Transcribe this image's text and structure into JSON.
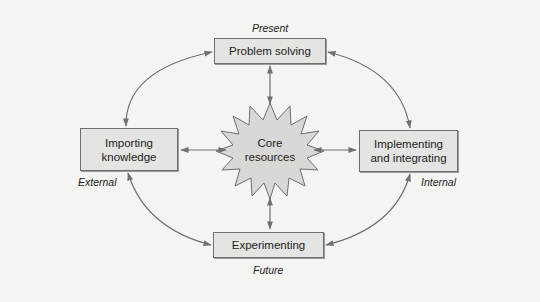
{
  "diagram": {
    "center": {
      "label_line1": "Core",
      "label_line2": "resources",
      "shape": "starburst"
    },
    "nodes": {
      "top": {
        "label": "Problem solving",
        "tag": "Present"
      },
      "left": {
        "label_line1": "Importing",
        "label_line2": "knowledge",
        "tag": "External"
      },
      "right": {
        "label_line1": "Implementing",
        "label_line2": "and integrating",
        "tag": "Internal"
      },
      "bottom": {
        "label": "Experimenting",
        "tag": "Future"
      }
    },
    "connections": [
      {
        "from": "Problem solving",
        "to": "Core resources",
        "type": "bidirectional"
      },
      {
        "from": "Importing knowledge",
        "to": "Core resources",
        "type": "bidirectional"
      },
      {
        "from": "Implementing and integrating",
        "to": "Core resources",
        "type": "bidirectional"
      },
      {
        "from": "Experimenting",
        "to": "Core resources",
        "type": "bidirectional"
      },
      {
        "from": "Problem solving",
        "to": "Importing knowledge",
        "type": "bidirectional-curved"
      },
      {
        "from": "Problem solving",
        "to": "Implementing and integrating",
        "type": "bidirectional-curved"
      },
      {
        "from": "Importing knowledge",
        "to": "Experimenting",
        "type": "bidirectional-curved"
      },
      {
        "from": "Implementing and integrating",
        "to": "Experimenting",
        "type": "bidirectional-curved"
      }
    ],
    "colors": {
      "background": "#f4f4f2",
      "box_fill": "#e4e4e2",
      "box_border": "#6e6e6e",
      "arrow": "#707070",
      "star_fill": "#d8d8d6"
    }
  }
}
